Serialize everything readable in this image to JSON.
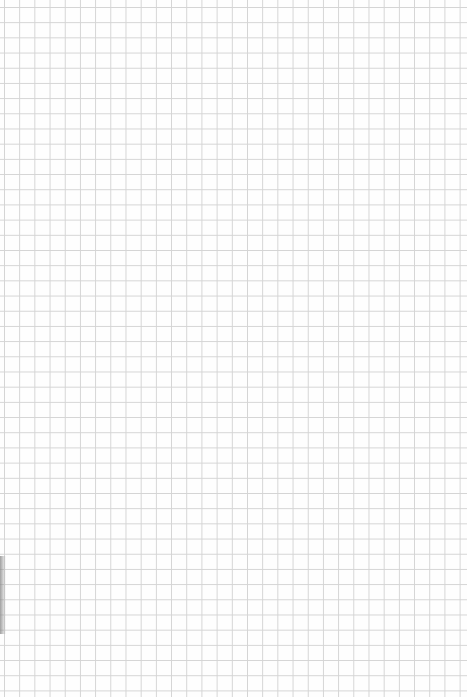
{
  "page": {
    "type": "grid-paper",
    "grid_spacing_px": 15,
    "line_color": "#d4d4d4",
    "background_color": "#fefefe",
    "content": ""
  }
}
